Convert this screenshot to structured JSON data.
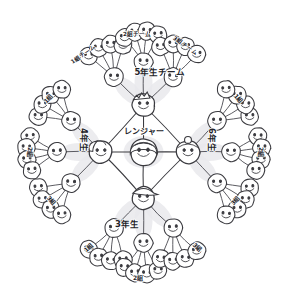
{
  "diagram": {
    "type": "radial-mindmap",
    "center": {
      "id": "ranger",
      "label": "レンジャー",
      "icon": "smiley-face-long-hair",
      "x": 143.5,
      "y": 152
    },
    "hubs": [
      {
        "id": "grade5",
        "label": "5年生チーム",
        "icon": "smiley-face-hub",
        "x": 143.5,
        "y": 105,
        "label_x": 160,
        "label_y": 75,
        "label_rot": 0,
        "label_size": 8.5
      },
      {
        "id": "grade4",
        "label": "4年生",
        "icon": "smiley-face-hub",
        "x": 101,
        "y": 152,
        "label_x": 81,
        "label_y": 140,
        "label_rot": 90,
        "label_size": 8.5
      },
      {
        "id": "grade6",
        "label": "6年生",
        "icon": "smiley-face-hub",
        "x": 188,
        "y": 152,
        "label_x": 209,
        "label_y": 140,
        "label_rot": 90,
        "label_size": 8.5
      },
      {
        "id": "grade3",
        "label": "3年生",
        "icon": "smiley-face-hub",
        "x": 143.5,
        "y": 198,
        "label_x": 127,
        "label_y": 227,
        "label_rot": 0,
        "label_size": 8.5
      }
    ],
    "groups": [
      {
        "id": "g5-c1",
        "hub": "grade5",
        "label": "1組チーム",
        "x": 114,
        "y": 77,
        "label_x": 84,
        "label_y": 56,
        "label_rot": -35,
        "label_size": 5.6
      },
      {
        "id": "g5-c2",
        "hub": "grade5",
        "label": "2組チーム",
        "x": 143.5,
        "y": 62,
        "label_x": 137,
        "label_y": 36,
        "label_rot": 0,
        "label_size": 5.6
      },
      {
        "id": "g5-c3",
        "hub": "grade5",
        "label": "3組チーム",
        "x": 173,
        "y": 77,
        "label_x": 184,
        "label_y": 47,
        "label_rot": 35,
        "label_size": 5.6
      },
      {
        "id": "g4-c1",
        "hub": "grade4",
        "label": "1組",
        "x": 71,
        "y": 121,
        "label_x": 50,
        "label_y": 100,
        "label_rot": -48,
        "label_size": 6.0
      },
      {
        "id": "g4-c2",
        "hub": "grade4",
        "label": "2組",
        "x": 57,
        "y": 152,
        "label_x": 28,
        "label_y": 152,
        "label_rot": 90,
        "label_size": 6.0
      },
      {
        "id": "g4-c3",
        "hub": "grade4",
        "label": "3組",
        "x": 71,
        "y": 183,
        "label_x": 50,
        "label_y": 202,
        "label_rot": 48,
        "label_size": 6.0
      },
      {
        "id": "g6-c1",
        "hub": "grade6",
        "label": "1組",
        "x": 217,
        "y": 121,
        "label_x": 237,
        "label_y": 100,
        "label_rot": 48,
        "label_size": 6.0
      },
      {
        "id": "g6-c2",
        "hub": "grade6",
        "label": "2組",
        "x": 231,
        "y": 152,
        "label_x": 259,
        "label_y": 152,
        "label_rot": 90,
        "label_size": 6.0
      },
      {
        "id": "g6-c3",
        "hub": "grade6",
        "label": "3組",
        "x": 217,
        "y": 183,
        "label_x": 237,
        "label_y": 202,
        "label_rot": -48,
        "label_size": 6.0
      },
      {
        "id": "g3-c1",
        "hub": "grade3",
        "label": "1組",
        "x": 114,
        "y": 228,
        "label_x": 90,
        "label_y": 249,
        "label_rot": -42,
        "label_size": 6.0
      },
      {
        "id": "g3-c2",
        "hub": "grade3",
        "label": "2組",
        "x": 143.5,
        "y": 243,
        "label_x": 138,
        "label_y": 280,
        "label_rot": 0,
        "label_size": 6.0
      },
      {
        "id": "g3-c3",
        "hub": "grade3",
        "label": "3組",
        "x": 173,
        "y": 228,
        "label_x": 196,
        "label_y": 249,
        "label_rot": 42,
        "label_size": 6.0
      }
    ],
    "members": {
      "icon": "smiley-face-member",
      "per_group": 4,
      "total_count": 48,
      "group_rings": [
        {
          "group": "g5-c1",
          "ring_angles": [
            -140,
            -118,
            -96,
            -74
          ],
          "radius": 33
        },
        {
          "group": "g5-c2",
          "ring_angles": [
            -128,
            -106,
            -84,
            -62
          ],
          "radius": 31
        },
        {
          "group": "g5-c3",
          "ring_angles": [
            -112,
            -90,
            -68,
            -44
          ],
          "radius": 33
        },
        {
          "group": "g4-c1",
          "ring_angles": [
            -172,
            -150,
            -128,
            -106
          ],
          "radius": 33
        },
        {
          "group": "g4-c2",
          "ring_angles": [
            -150,
            -172,
            166,
            144
          ],
          "radius": 31
        },
        {
          "group": "g4-c3",
          "ring_angles": [
            172,
            150,
            128,
            106
          ],
          "radius": 33
        },
        {
          "group": "g6-c1",
          "ring_angles": [
            -8,
            -30,
            -52,
            -74
          ],
          "radius": 33
        },
        {
          "group": "g6-c2",
          "ring_angles": [
            -30,
            -8,
            14,
            36
          ],
          "radius": 31
        },
        {
          "group": "g6-c3",
          "ring_angles": [
            8,
            30,
            52,
            74
          ],
          "radius": 33
        },
        {
          "group": "g3-c1",
          "ring_angles": [
            140,
            118,
            96,
            74
          ],
          "radius": 33
        },
        {
          "group": "g3-c2",
          "ring_angles": [
            128,
            106,
            84,
            62
          ],
          "radius": 31
        },
        {
          "group": "g3-c3",
          "ring_angles": [
            112,
            90,
            68,
            44
          ],
          "radius": 33
        }
      ]
    },
    "style": {
      "ink_color": "#3a3a3f",
      "paper_color": "#ffffff",
      "highlight_color": "#e9e9ec",
      "line_width": 1.0
    }
  }
}
